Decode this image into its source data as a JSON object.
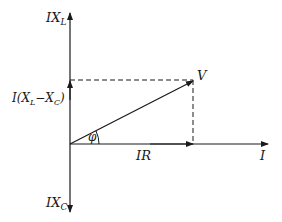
{
  "diagram": {
    "type": "phasor-diagram",
    "labels": {
      "ixl": "IX",
      "ixl_sub": "L",
      "ixc": "IX",
      "ixc_sub": "C",
      "net_reactive_prefix": "I(X",
      "net_reactive_sub1": "L",
      "net_reactive_mid": "−X",
      "net_reactive_sub2": "C",
      "net_reactive_suffix": ")",
      "voltage": "V",
      "phase_angle": "φ",
      "resistive_drop": "IR",
      "current": "I"
    },
    "colors": {
      "stroke": "#1a1a1a",
      "background": "#ffffff"
    }
  }
}
